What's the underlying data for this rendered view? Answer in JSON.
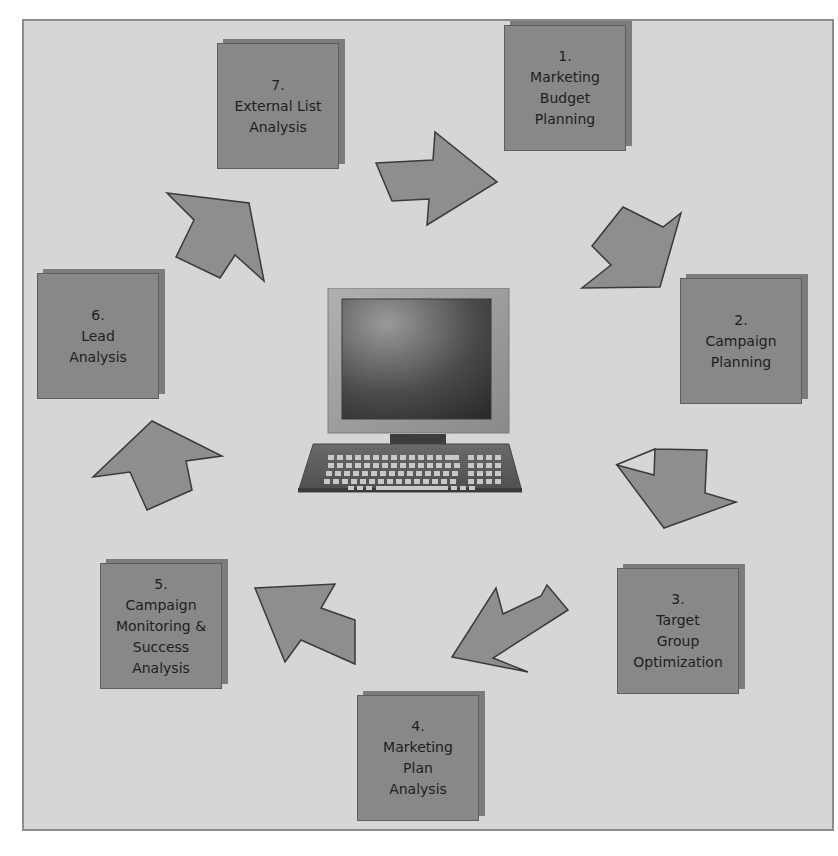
{
  "diagram": {
    "type": "cycle",
    "center_icon": "computer-workstation-icon",
    "colors": {
      "background": "#d6d6d6",
      "frame_border": "#8c8c8c",
      "box_fill": "#888888",
      "box_shadow": "#7c7c7c",
      "arrow_fill": "#8e8e8e",
      "arrow_stroke": "#3a3a3a",
      "text": "#1e1e1e"
    },
    "steps": [
      {
        "number": "1.",
        "lines": [
          "Marketing",
          "Budget",
          "Planning"
        ]
      },
      {
        "number": "2.",
        "lines": [
          "Campaign",
          "Planning"
        ]
      },
      {
        "number": "3.",
        "lines": [
          "Target",
          "Group",
          "Optimization"
        ]
      },
      {
        "number": "4.",
        "lines": [
          "Marketing",
          "Plan",
          "Analysis"
        ]
      },
      {
        "number": "5.",
        "lines": [
          "Campaign",
          "Monitoring &",
          "Success",
          "Analysis"
        ]
      },
      {
        "number": "6.",
        "lines": [
          "Lead",
          "Analysis"
        ]
      },
      {
        "number": "7.",
        "lines": [
          "External List",
          "Analysis"
        ]
      }
    ],
    "arrows": [
      {
        "from": "7",
        "to": "1",
        "direction": "right"
      },
      {
        "from": "1",
        "to": "2",
        "direction": "down-right"
      },
      {
        "from": "2",
        "to": "3",
        "direction": "down-right"
      },
      {
        "from": "3",
        "to": "4",
        "direction": "down-left"
      },
      {
        "from": "4",
        "to": "5",
        "direction": "up-left"
      },
      {
        "from": "5",
        "to": "6",
        "direction": "up"
      },
      {
        "from": "6",
        "to": "7",
        "direction": "up-right"
      }
    ]
  }
}
